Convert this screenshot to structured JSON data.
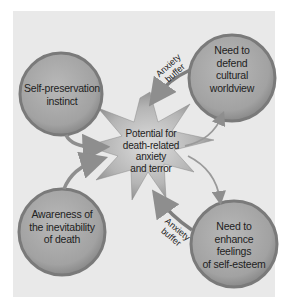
{
  "diagram": {
    "center": {
      "label_lines": [
        "Potential for",
        "death-related",
        "anxiety",
        "and terror"
      ]
    },
    "nodes": [
      {
        "id": "self-preservation",
        "position": "top-left",
        "label_lines": [
          "Self-preservation",
          "instinct"
        ]
      },
      {
        "id": "cultural-worldview",
        "position": "top-right",
        "label_lines": [
          "Need to",
          "defend",
          "cultural",
          "worldview"
        ]
      },
      {
        "id": "awareness-death",
        "position": "bottom-left",
        "label_lines": [
          "Awareness of",
          "the inevitability",
          "of death"
        ]
      },
      {
        "id": "self-esteem",
        "position": "bottom-right",
        "label_lines": [
          "Need to",
          "enhance",
          "feelings",
          "of self-esteem"
        ]
      }
    ],
    "buffers": [
      {
        "position": "top",
        "label_lines": [
          "Anxiety",
          "buffer"
        ]
      },
      {
        "position": "bottom",
        "label_lines": [
          "Anxiety",
          "buffer"
        ]
      }
    ],
    "colors": {
      "background": "#e9e9e9",
      "circle_fill": "#a9a9a9",
      "circle_rim": "#7d7d7d",
      "arrow": "#8e8e8e"
    }
  }
}
